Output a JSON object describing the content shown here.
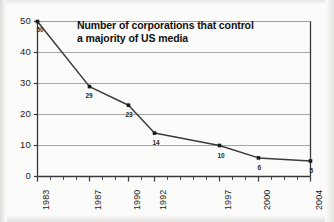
{
  "chart_data": {
    "type": "line",
    "title": "Number of corporations that control a majority of US media",
    "title_line1": "Number of corporations that control",
    "title_line2": "a majority of US media",
    "xlabel": "",
    "ylabel": "",
    "x": [
      1983,
      1987,
      1990,
      1992,
      1997,
      2000,
      2004
    ],
    "categories": [
      "1983",
      "1987",
      "1990",
      "1992",
      "1997",
      "2000",
      "2004"
    ],
    "values": [
      50,
      29,
      23,
      14,
      10,
      6,
      5
    ],
    "point_labels": [
      "50",
      "29",
      "23",
      "14",
      "10",
      "6",
      "5"
    ],
    "ylim": [
      0,
      50
    ],
    "xlim": [
      1983,
      2004
    ],
    "yticks": [
      "0",
      "10",
      "20",
      "30",
      "40",
      "50"
    ],
    "ytick_values": [
      0,
      10,
      20,
      30,
      40,
      50
    ],
    "xticks": [
      "1983",
      "1987",
      "1990",
      "1992",
      "1997",
      "2000",
      "2004"
    ],
    "minor_xticks_every": 1,
    "grid": "horizontal",
    "legend": "none",
    "line_color": "#3a3a3a",
    "marker_color": "#1a1a1a",
    "grid_color": "#9b9b9b",
    "axis_color": "#3a3a3a",
    "background_color": "#fbfbfa"
  },
  "colors": {
    "line": "#3a3a3a",
    "marker": "#1a1a1a",
    "grid": "#9b9b9b",
    "axis": "#3a3a3a",
    "text": "#1b1b1b",
    "background": "#fbfbfa"
  }
}
